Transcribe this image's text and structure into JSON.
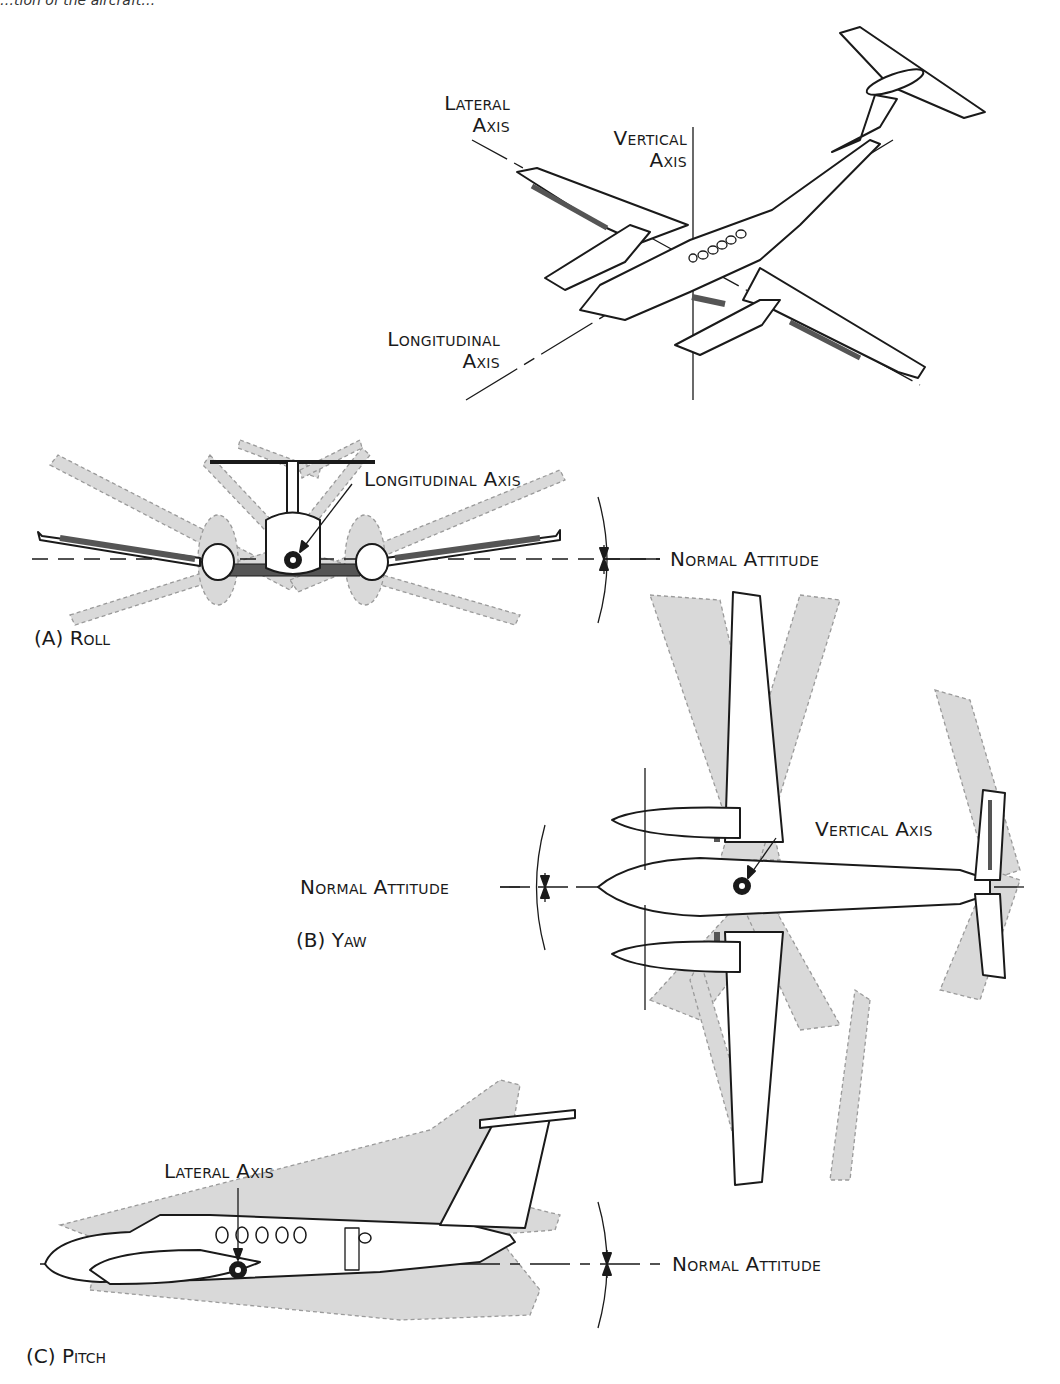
{
  "header_fragment": "…tion of the aircraft…",
  "figure": {
    "isometric_view": {
      "labels": {
        "lateral_axis_line1": "Lateral",
        "lateral_axis_line2": "Axis",
        "vertical_axis_line1": "Vertical",
        "vertical_axis_line2": "Axis",
        "longitudinal_axis_line1": "Longitudinal",
        "longitudinal_axis_line2": "Axis"
      }
    },
    "panels": [
      {
        "id": "A",
        "caption": "(A) Roll",
        "axis_label": "Longitudinal Axis",
        "reference_label": "Normal Attitude"
      },
      {
        "id": "B",
        "caption": "(B) Yaw",
        "axis_label": "Vertical Axis",
        "reference_label": "Normal Attitude"
      },
      {
        "id": "C",
        "caption": "(C) Pitch",
        "axis_label": "Lateral Axis",
        "reference_label": "Normal Attitude"
      }
    ]
  },
  "colors": {
    "line": "#1a1a1a",
    "ghost_fill": "#d9d9d9",
    "ghost_stroke": "#9a9a9a",
    "control_surface": "#555555"
  }
}
